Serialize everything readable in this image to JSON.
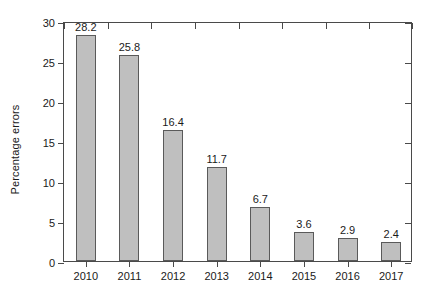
{
  "chart_data": {
    "type": "bar",
    "title": "",
    "xlabel": "",
    "ylabel": "Percentage errors",
    "categories": [
      "2010",
      "2011",
      "2012",
      "2013",
      "2014",
      "2015",
      "2016",
      "2017"
    ],
    "values": [
      28.2,
      25.8,
      16.4,
      11.7,
      6.7,
      3.6,
      2.9,
      2.4
    ],
    "value_labels": [
      "28.2",
      "25.8",
      "16.4",
      "11.7",
      "6.7",
      "3.6",
      "2.9",
      "2.4"
    ],
    "ylim": [
      0,
      30
    ],
    "yticks": [
      0,
      5,
      10,
      15,
      20,
      25,
      30
    ],
    "ytick_labels": [
      "0",
      "5",
      "10",
      "15",
      "20",
      "25",
      "30"
    ],
    "grid": false,
    "legend": null,
    "bar_color": "#bfbfbf",
    "bar_edge_color": "#5a5a5a",
    "axis_color": "#4a4a4a",
    "background": "#ffffff"
  }
}
